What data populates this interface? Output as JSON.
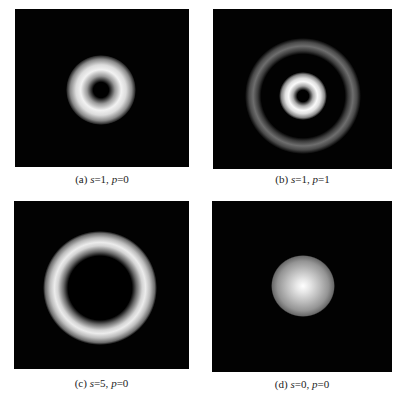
{
  "figure": {
    "panels": [
      {
        "id": "a",
        "label": "(a)",
        "s_var": "s",
        "s_value": "=1, ",
        "p_var": "p",
        "p_value": "=0",
        "description": "donut-shaped vortex beam intensity, single bright ring with dark center"
      },
      {
        "id": "b",
        "label": "(b)",
        "s_var": "s",
        "s_value": "=1, ",
        "p_var": "p",
        "p_value": "=1",
        "description": "bright inner ring with dark center surrounded by a fainter outer ring"
      },
      {
        "id": "c",
        "label": "(c)",
        "s_var": "s",
        "s_value": "=5, ",
        "p_var": "p",
        "p_value": "=0",
        "description": "large single ring with wide dark center"
      },
      {
        "id": "d",
        "label": "(d)",
        "s_var": "s",
        "s_value": "=0, ",
        "p_var": "p",
        "p_value": "=0",
        "description": "Gaussian spot, bright center"
      }
    ],
    "colors": {
      "background": "#ffffff",
      "panel_background": "#020202",
      "beam_peak": "#f2f2f2",
      "caption_text": "#222222"
    }
  }
}
